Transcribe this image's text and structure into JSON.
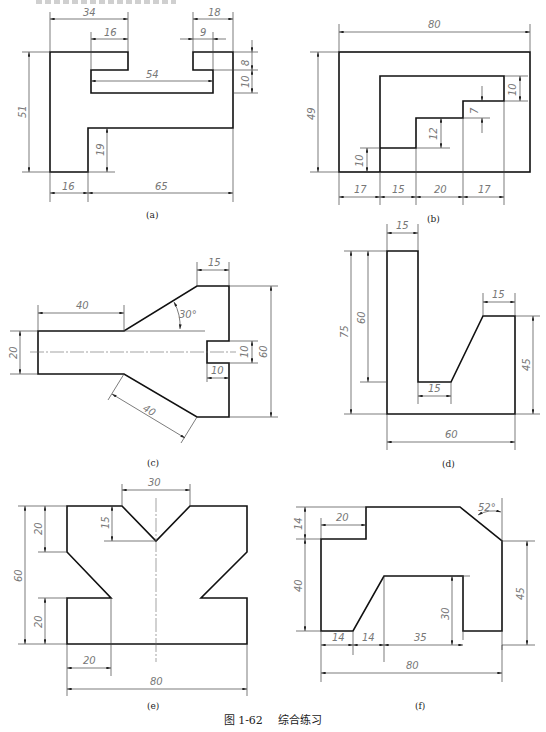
{
  "header": {
    "clipped_text": ""
  },
  "figure": {
    "number": "图 1-62",
    "title": "综合练习"
  },
  "drawings": [
    {
      "id": "a",
      "label": "(a)",
      "dims": [
        "34",
        "16",
        "18",
        "9",
        "8",
        "10",
        "54",
        "51",
        "19",
        "16",
        "65"
      ]
    },
    {
      "id": "b",
      "label": "(b)",
      "dims": [
        "80",
        "49",
        "10",
        "7",
        "12",
        "10",
        "17",
        "15",
        "20",
        "17"
      ]
    },
    {
      "id": "c",
      "label": "(c)",
      "dims": [
        "15",
        "40",
        "30°",
        "20",
        "10",
        "10",
        "60",
        "40"
      ]
    },
    {
      "id": "d",
      "label": "(d)",
      "dims": [
        "15",
        "75",
        "60",
        "15",
        "15",
        "45",
        "60"
      ]
    },
    {
      "id": "e",
      "label": "(e)",
      "dims": [
        "30",
        "15",
        "20",
        "60",
        "20",
        "20",
        "80"
      ]
    },
    {
      "id": "f",
      "label": "(f)",
      "dims": [
        "52°",
        "14",
        "20",
        "40",
        "30",
        "45",
        "14",
        "14",
        "35",
        "80"
      ]
    }
  ]
}
